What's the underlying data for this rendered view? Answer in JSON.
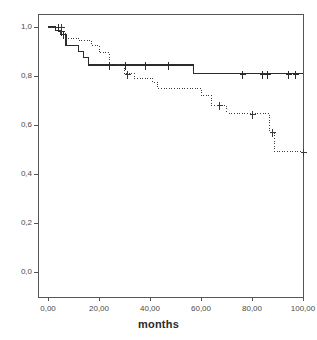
{
  "chart_data": {
    "type": "line",
    "title": "",
    "subtitle": "",
    "xlabel": "months",
    "ylabel": "",
    "xlim": [
      0,
      104
    ],
    "ylim": [
      0,
      1.04
    ],
    "grid": false,
    "legend": "none",
    "x_tick_labels": [
      "0,00",
      "20,00",
      "40,00",
      "60,00",
      "80,00",
      "100,00"
    ],
    "x_tick_values": [
      0,
      20,
      40,
      60,
      80,
      100
    ],
    "y_tick_labels": [
      "1,0",
      "0,8",
      "0,6",
      "0,4",
      "0,2",
      "0,0"
    ],
    "y_tick_values": [
      1.0,
      0.8,
      0.6,
      0.4,
      0.2,
      0.0
    ],
    "series": [
      {
        "name": "group-1-solid",
        "style": "solid",
        "color": "#2b2b2b",
        "steps": [
          [
            0,
            1.0
          ],
          [
            3,
            1.0
          ],
          [
            3,
            0.985
          ],
          [
            5,
            0.985
          ],
          [
            5,
            0.97
          ],
          [
            7,
            0.97
          ],
          [
            7,
            0.925
          ],
          [
            12,
            0.925
          ],
          [
            12,
            0.9
          ],
          [
            14,
            0.9
          ],
          [
            14,
            0.875
          ],
          [
            16,
            0.875
          ],
          [
            16,
            0.845
          ],
          [
            57,
            0.845
          ],
          [
            57,
            0.81
          ],
          [
            100,
            0.81
          ]
        ],
        "censor_marks": [
          [
            4,
            1.0
          ],
          [
            5,
            0.985
          ],
          [
            6,
            0.97
          ],
          [
            24,
            0.845
          ],
          [
            30,
            0.845
          ],
          [
            38,
            0.845
          ],
          [
            47,
            0.845
          ],
          [
            76,
            0.81
          ],
          [
            84,
            0.81
          ],
          [
            86,
            0.81
          ],
          [
            94,
            0.81
          ],
          [
            97,
            0.81
          ]
        ]
      },
      {
        "name": "group-2-dotted",
        "style": "dotted",
        "color": "#3a3a3a",
        "steps": [
          [
            0,
            1.0
          ],
          [
            5,
            1.0
          ],
          [
            5,
            0.975
          ],
          [
            7,
            0.975
          ],
          [
            7,
            0.955
          ],
          [
            12,
            0.955
          ],
          [
            12,
            0.945
          ],
          [
            17,
            0.945
          ],
          [
            17,
            0.925
          ],
          [
            20,
            0.925
          ],
          [
            20,
            0.895
          ],
          [
            24,
            0.895
          ],
          [
            24,
            0.845
          ],
          [
            30,
            0.845
          ],
          [
            30,
            0.81
          ],
          [
            34,
            0.81
          ],
          [
            34,
            0.79
          ],
          [
            41,
            0.79
          ],
          [
            41,
            0.775
          ],
          [
            43,
            0.775
          ],
          [
            43,
            0.75
          ],
          [
            60,
            0.75
          ],
          [
            60,
            0.72
          ],
          [
            64,
            0.72
          ],
          [
            64,
            0.68
          ],
          [
            70,
            0.68
          ],
          [
            70,
            0.645
          ],
          [
            87,
            0.645
          ],
          [
            87,
            0.57
          ],
          [
            89,
            0.57
          ],
          [
            89,
            0.49
          ],
          [
            100,
            0.49
          ]
        ],
        "censor_marks": [
          [
            5,
            1.0
          ],
          [
            31,
            0.81
          ],
          [
            67,
            0.68
          ],
          [
            80,
            0.645
          ],
          [
            88,
            0.57
          ],
          [
            100,
            0.49
          ]
        ]
      }
    ]
  },
  "axis": {
    "x_title": "months"
  },
  "colors": {
    "frame": "#555555",
    "tick_text": "#4a4a4a",
    "series_1": "#2b2b2b",
    "series_2": "#3a3a3a",
    "background": "#ffffff"
  }
}
